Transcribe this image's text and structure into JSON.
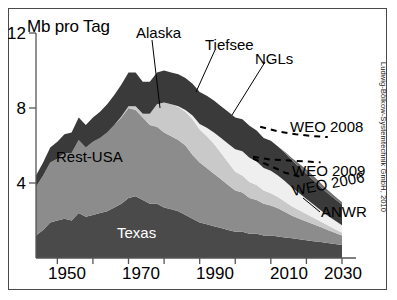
{
  "chart_data": {
    "type": "area",
    "stacked": true,
    "title": "",
    "ylabel": "Mb pro Tag",
    "xlabel": "",
    "xlim": [
      1944,
      2030
    ],
    "ylim": [
      0,
      12
    ],
    "yticks": [
      0,
      4,
      8,
      12
    ],
    "ytick_labels": [
      "",
      "4",
      "8",
      "12"
    ],
    "xticks": [
      1950,
      1960,
      1970,
      1980,
      1990,
      2000,
      2010,
      2020,
      2030
    ],
    "xtick_labels": [
      "1950",
      "",
      "1970",
      "",
      "1990",
      "",
      "2010",
      "",
      "2030"
    ],
    "grid": false,
    "legend_position": "inline-annotations",
    "x": [
      1944,
      1946,
      1948,
      1950,
      1952,
      1954,
      1956,
      1958,
      1960,
      1962,
      1964,
      1966,
      1968,
      1970,
      1972,
      1974,
      1976,
      1978,
      1980,
      1982,
      1984,
      1986,
      1988,
      1990,
      1992,
      1994,
      1996,
      1998,
      2000,
      2002,
      2004,
      2006,
      2008,
      2010,
      2012,
      2014,
      2016,
      2018,
      2020,
      2022,
      2024,
      2026,
      2028,
      2030
    ],
    "series": [
      {
        "name": "Texas",
        "color": "#4a4a4a",
        "values": [
          1.2,
          1.5,
          1.9,
          2.0,
          2.1,
          2.0,
          2.4,
          2.2,
          2.3,
          2.4,
          2.5,
          2.7,
          2.9,
          3.2,
          3.3,
          3.1,
          2.9,
          2.9,
          2.7,
          2.6,
          2.5,
          2.3,
          2.1,
          1.9,
          1.8,
          1.7,
          1.6,
          1.5,
          1.4,
          1.4,
          1.3,
          1.3,
          1.2,
          1.2,
          1.15,
          1.1,
          1.05,
          1.0,
          0.95,
          0.9,
          0.85,
          0.8,
          0.75,
          0.7
        ]
      },
      {
        "name": "Rest-USA",
        "color": "#8c8c8c",
        "values": [
          2.6,
          2.9,
          3.2,
          3.3,
          3.5,
          3.6,
          3.9,
          3.7,
          3.9,
          4.0,
          4.2,
          4.4,
          4.6,
          4.8,
          4.6,
          4.4,
          4.2,
          4.1,
          4.0,
          3.9,
          3.8,
          3.7,
          3.4,
          3.2,
          3.0,
          2.8,
          2.6,
          2.4,
          2.2,
          2.1,
          1.9,
          1.8,
          1.7,
          1.6,
          1.5,
          1.35,
          1.2,
          1.1,
          1.0,
          0.9,
          0.8,
          0.7,
          0.6,
          0.5
        ]
      },
      {
        "name": "Alaska",
        "color": "#c9c9c9",
        "values": [
          0,
          0,
          0,
          0,
          0,
          0,
          0,
          0,
          0,
          0,
          0,
          0,
          0.05,
          0.1,
          0.2,
          0.2,
          0.6,
          1.2,
          1.6,
          1.7,
          1.75,
          1.8,
          1.9,
          1.75,
          1.7,
          1.6,
          1.4,
          1.2,
          1.0,
          0.9,
          0.85,
          0.8,
          0.7,
          0.65,
          0.6,
          0.55,
          0.5,
          0.45,
          0.4,
          0.35,
          0.3,
          0.25,
          0.2,
          0.15
        ]
      },
      {
        "name": "Tiefsee",
        "color": "#efefef",
        "values": [
          0,
          0,
          0,
          0,
          0,
          0,
          0,
          0,
          0,
          0,
          0,
          0,
          0,
          0,
          0,
          0,
          0,
          0,
          0,
          0,
          0.05,
          0.1,
          0.2,
          0.3,
          0.45,
          0.6,
          0.8,
          1.0,
          1.2,
          1.3,
          1.3,
          1.25,
          1.2,
          1.2,
          1.15,
          1.1,
          1.0,
          0.9,
          0.8,
          0.7,
          0.6,
          0.5,
          0.45,
          0.4
        ]
      },
      {
        "name": "NGLs",
        "color": "#3a3a3a",
        "values": [
          0.6,
          0.7,
          0.8,
          0.9,
          1.0,
          1.1,
          1.2,
          1.2,
          1.3,
          1.4,
          1.5,
          1.6,
          1.7,
          1.8,
          1.8,
          1.7,
          1.7,
          1.7,
          1.7,
          1.7,
          1.7,
          1.7,
          1.7,
          1.7,
          1.7,
          1.7,
          1.7,
          1.7,
          1.7,
          1.7,
          1.7,
          1.65,
          1.6,
          1.6,
          1.55,
          1.5,
          1.45,
          1.4,
          1.35,
          1.3,
          1.25,
          1.2,
          1.15,
          1.1
        ]
      },
      {
        "name": "ANWR",
        "color": "#6f6f6f",
        "values": [
          0,
          0,
          0,
          0,
          0,
          0,
          0,
          0,
          0,
          0,
          0,
          0,
          0,
          0,
          0,
          0,
          0,
          0,
          0,
          0,
          0,
          0,
          0,
          0,
          0,
          0,
          0,
          0,
          0,
          0,
          0,
          0,
          0,
          0,
          0,
          0.05,
          0.12,
          0.18,
          0.22,
          0.22,
          0.2,
          0.18,
          0.15,
          0.12
        ]
      }
    ],
    "projection_lines": [
      {
        "name": "WEO 2008",
        "style": "dashed",
        "points": [
          [
            2007,
            7.0
          ],
          [
            2012,
            6.75
          ],
          [
            2017,
            6.6
          ],
          [
            2022,
            6.5
          ],
          [
            2026,
            6.45
          ]
        ]
      },
      {
        "name": "WEO 2009",
        "style": "dashed",
        "points": [
          [
            2005,
            5.4
          ],
          [
            2010,
            5.25
          ],
          [
            2015,
            5.2
          ],
          [
            2020,
            5.15
          ],
          [
            2024,
            5.1
          ]
        ]
      },
      {
        "name": "WEO 2006",
        "style": "dashed",
        "points": [
          [
            2005,
            5.3
          ],
          [
            2010,
            4.9
          ],
          [
            2014,
            4.55
          ],
          [
            2018,
            4.35
          ]
        ]
      }
    ],
    "annotations": [
      {
        "text": "Alaska",
        "target_series": "Alaska"
      },
      {
        "text": "Tiefsee",
        "target_series": "Tiefsee"
      },
      {
        "text": "NGLs",
        "target_series": "NGLs"
      },
      {
        "text": "Rest-USA",
        "target_series": "Rest-USA"
      },
      {
        "text": "Texas",
        "target_series": "Texas"
      },
      {
        "text": "ANWR",
        "target_series": "ANWR"
      }
    ]
  },
  "axis": {
    "ylabel": "Mb pro Tag",
    "y12": "12",
    "y8": "8",
    "y4": "4",
    "x1950": "1950",
    "x1970": "1970",
    "x1990": "1990",
    "x2010": "2010",
    "x2030": "2030"
  },
  "labels": {
    "alaska": "Alaska",
    "tiefsee": "Tiefsee",
    "ngls": "NGLs",
    "rest_usa": "Rest-USA",
    "texas": "Texas",
    "anwr": "ANWR",
    "weo2008": "WEO 2008",
    "weo2009": "WEO 2009",
    "weo2006": "WEO 2006"
  },
  "credit": {
    "text": "Ludwig-Bölkow-Systemtechnik GmbH, 2010"
  }
}
